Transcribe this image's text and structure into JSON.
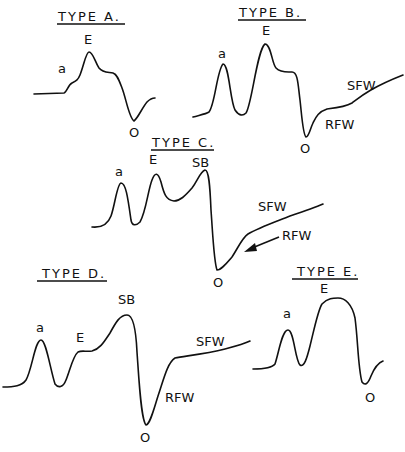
{
  "panels": [
    {
      "id": "type-a",
      "title": "TYPE A.",
      "labels": {
        "a": "a",
        "E": "E",
        "O": "O"
      }
    },
    {
      "id": "type-b",
      "title": "TYPE B.",
      "labels": {
        "a": "a",
        "E": "E",
        "O": "O",
        "SFW": "SFW",
        "RFW": "RFW"
      }
    },
    {
      "id": "type-c",
      "title": "TYPE C.",
      "labels": {
        "a": "a",
        "E": "E",
        "SB": "SB",
        "O": "O",
        "SFW": "SFW",
        "RFW": "RFW"
      }
    },
    {
      "id": "type-d",
      "title": "TYPE D.",
      "labels": {
        "a": "a",
        "E": "E",
        "SB": "SB",
        "O": "O",
        "SFW": "SFW",
        "RFW": "RFW"
      }
    },
    {
      "id": "type-e",
      "title": "TYPE E.",
      "labels": {
        "a": "a",
        "E": "E",
        "O": "O"
      }
    }
  ],
  "colors": {
    "ink": "#111111",
    "background": "#ffffff"
  }
}
